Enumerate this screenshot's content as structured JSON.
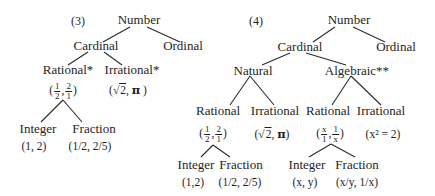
{
  "diagram3": {
    "label": "(3)",
    "root": "Number",
    "cardinal": "Cardinal",
    "ordinal": "Ordinal",
    "rational": "Rational*",
    "irrational": "Irrational*",
    "rational_example": {
      "a_num": "1",
      "a_den": "2",
      "b_num": "2",
      "b_den": "1"
    },
    "irrational_example": {
      "sqrt": "2",
      "pi": "π"
    },
    "integer": "Integer",
    "integer_example": "(1, 2)",
    "fraction": "Fraction",
    "fraction_example": "(1/2, 2/5)"
  },
  "diagram4": {
    "label": "(4)",
    "root": "Number",
    "cardinal": "Cardinal",
    "ordinal": "Ordinal",
    "natural": "Natural",
    "algebraic": "Algebraic**",
    "natural_rational": "Rational",
    "natural_irrational": "Irrational",
    "natural_rational_example": {
      "a_num": "1",
      "a_den": "2",
      "b_num": "2",
      "b_den": "1"
    },
    "natural_irrational_example": {
      "sqrt": "2",
      "pi": "π"
    },
    "algebraic_rational": "Rational",
    "algebraic_irrational": "Irrational",
    "algebraic_rational_example": {
      "a_num": "x",
      "a_den": "1",
      "b_num": "1",
      "b_den": "x"
    },
    "algebraic_irrational_example": "(x² = 2)",
    "natural_integer": "Integer",
    "natural_integer_example": "(1,2)",
    "natural_fraction": "Fraction",
    "natural_fraction_example": "(1/2, 2/5)",
    "algebraic_integer": "Integer",
    "algebraic_integer_example": "(x, y)",
    "algebraic_fraction": "Fraction",
    "algebraic_fraction_example": "(x/y, 1/x)"
  }
}
